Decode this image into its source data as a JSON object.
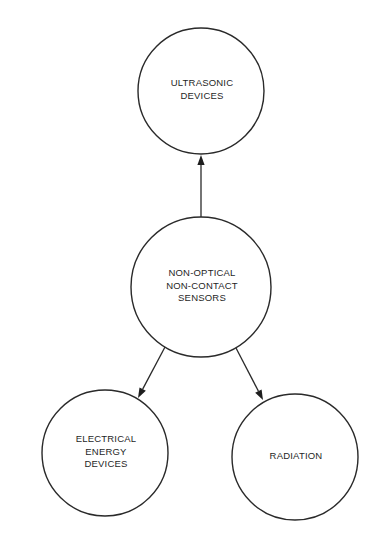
{
  "diagram": {
    "type": "hierarchy",
    "root": "center",
    "nodes": {
      "top": {
        "id": "ultrasonic",
        "lines": [
          "ULTRASONIC",
          "DEVICES"
        ],
        "cx": 201,
        "cy": 91,
        "r": 63
      },
      "center": {
        "id": "non-optical-non-contact-sensors",
        "lines": [
          "NON-OPTICAL",
          "NON-CONTACT",
          "SENSORS"
        ],
        "cx": 201,
        "cy": 287,
        "r": 70
      },
      "bottom_left": {
        "id": "electrical-energy",
        "lines": [
          "ELECTRICAL",
          "ENERGY",
          "DEVICES"
        ],
        "cx": 105,
        "cy": 453,
        "r": 63
      },
      "bottom_right": {
        "id": "radiation",
        "lines": [
          "RADIATION"
        ],
        "cx": 295,
        "cy": 457,
        "r": 63
      }
    },
    "edges": [
      {
        "from": "center",
        "to": "top",
        "x1": 201,
        "y1": 217,
        "x2": 201,
        "y2": 155
      },
      {
        "from": "center",
        "to": "bottom_left",
        "x1": 165,
        "y1": 347,
        "x2": 138,
        "y2": 398
      },
      {
        "from": "center",
        "to": "bottom_right",
        "x1": 236,
        "y1": 348,
        "x2": 263,
        "y2": 400
      }
    ],
    "colors": {
      "stroke": "#2a2a2a",
      "text": "#1f1f1f",
      "background": "#ffffff"
    }
  }
}
